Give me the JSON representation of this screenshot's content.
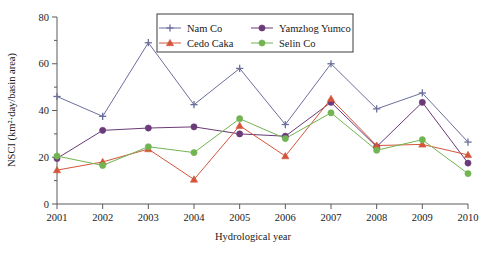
{
  "chart_data": {
    "type": "line",
    "title": "",
    "xlabel": "Hydrological year",
    "ylabel": "NSCI (km²·day/basin area)",
    "categories": [
      "2001",
      "2002",
      "2003",
      "2004",
      "2005",
      "2006",
      "2007",
      "2008",
      "2009",
      "2010"
    ],
    "x": [
      2001,
      2002,
      2003,
      2004,
      2005,
      2006,
      2007,
      2008,
      2009,
      2010
    ],
    "xlim": [
      2001,
      2010
    ],
    "ylim": [
      0,
      80
    ],
    "yticks": [
      0,
      20,
      40,
      60,
      80
    ],
    "ytick_labels": [
      "0",
      "20",
      "40",
      "60",
      "80"
    ],
    "grid": false,
    "legend_position": "top-center",
    "series": [
      {
        "name": "Nam Co",
        "marker": "plus",
        "color": "#6b6f9c",
        "values": [
          46.0,
          37.5,
          69.0,
          42.5,
          58.0,
          34.0,
          60.0,
          40.7,
          47.5,
          26.5
        ]
      },
      {
        "name": "Yamzhog Yumco",
        "marker": "circle",
        "color": "#6b3a78",
        "values": [
          19.5,
          31.5,
          32.5,
          33.0,
          30.0,
          29.0,
          43.5,
          24.5,
          43.5,
          17.5
        ]
      },
      {
        "name": "Cedo Caka",
        "marker": "triangle",
        "color": "#d4553a",
        "values": [
          14.5,
          18.0,
          23.5,
          10.5,
          33.5,
          20.5,
          45.0,
          25.0,
          25.5,
          21.0
        ]
      },
      {
        "name": "Selin Co",
        "marker": "circle",
        "color": "#72b451",
        "values": [
          20.5,
          16.5,
          24.5,
          22.0,
          36.5,
          28.0,
          39.0,
          23.0,
          27.5,
          13.0
        ]
      }
    ]
  },
  "axes": {
    "y_title": "NSCI (km²·day/basin area)",
    "x_title": "Hydrological year",
    "y_ticks": [
      "80",
      "60",
      "40",
      "20",
      "0"
    ],
    "x_ticks": [
      "2001",
      "2002",
      "2003",
      "2004",
      "2005",
      "2006",
      "2007",
      "2008",
      "2009",
      "2010"
    ]
  },
  "legend": {
    "entries": [
      {
        "label": "Nam Co",
        "color": "#6b6f9c",
        "marker": "plus-icon"
      },
      {
        "label": "Yamzhog Yumco",
        "color": "#6b3a78",
        "marker": "circle-icon"
      },
      {
        "label": "Cedo Caka",
        "color": "#d4553a",
        "marker": "triangle-icon"
      },
      {
        "label": "Selin Co",
        "color": "#72b451",
        "marker": "circle-icon"
      }
    ]
  }
}
